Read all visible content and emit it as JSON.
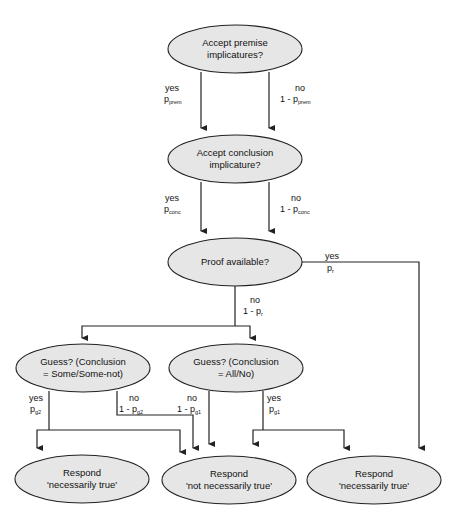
{
  "diagram": {
    "type": "multinomial processing tree / flowchart",
    "colors": {
      "node_fill": "#e6e6e6",
      "stroke": "#222222",
      "background": "#ffffff"
    },
    "nodes": {
      "premise": {
        "line1": "Accept premise",
        "line2": "implicatures?"
      },
      "conclusion": {
        "line1": "Accept conclusion",
        "line2": "implicature?"
      },
      "proof": {
        "line1": "Proof available?"
      },
      "guess_some": {
        "line1": "Guess?   (Conclusion",
        "line2": "= Some/Some-not)"
      },
      "guess_all": {
        "line1": "Guess?   (Conclusion",
        "line2": "= All/No)"
      },
      "resp_nt_left": {
        "line1": "Respond",
        "line2": "'necessarily true'"
      },
      "resp_nnt": {
        "line1": "Respond",
        "line2": "'not necessarily true'"
      },
      "resp_nt_right": {
        "line1": "Respond",
        "line2": "'necessarily true'"
      }
    },
    "edges": {
      "premise_yes": {
        "answer": "yes",
        "prob": "p",
        "sub": "prem"
      },
      "premise_no": {
        "answer": "no",
        "prob": "1  -  p",
        "sub": "prem"
      },
      "conclusion_yes": {
        "answer": "yes",
        "prob": "p",
        "sub": "conc"
      },
      "conclusion_no": {
        "answer": "no",
        "prob": "1  -  p",
        "sub": "conc"
      },
      "proof_yes": {
        "answer": "yes",
        "prob": "p",
        "sub": "r"
      },
      "proof_no": {
        "answer": "no",
        "prob": "1  -  p",
        "sub": "r"
      },
      "g2_yes": {
        "answer": "yes",
        "prob": "p",
        "sub": "g2"
      },
      "g2_no": {
        "answer": "no",
        "prob": "1  -  p",
        "sub": "g2"
      },
      "g1_no": {
        "answer": "no",
        "prob": "1  -  p",
        "sub": "g1"
      },
      "g1_yes": {
        "answer": "yes",
        "prob": "p",
        "sub": "g1"
      }
    }
  }
}
